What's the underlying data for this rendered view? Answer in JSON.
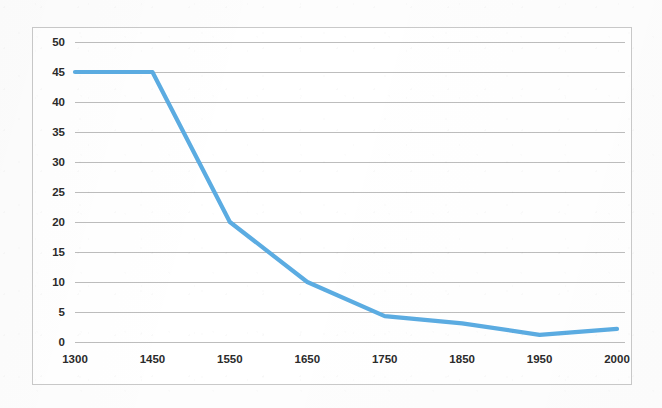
{
  "chart_data": {
    "type": "line",
    "title": "",
    "subtitle": "",
    "xlabel": "",
    "ylabel": "",
    "categories": [
      "1300",
      "1450",
      "1550",
      "1650",
      "1750",
      "1850",
      "1950",
      "2000"
    ],
    "values": [
      45,
      45,
      20,
      10,
      4.3,
      3.1,
      1.2,
      2.2
    ],
    "series": [
      {
        "name": "Series 1",
        "values": [
          45,
          45,
          20,
          10,
          4.3,
          3.1,
          1.2,
          2.2
        ]
      }
    ],
    "ylim": [
      0,
      50
    ],
    "y_ticks": [
      0,
      5,
      10,
      15,
      20,
      25,
      30,
      35,
      40,
      45,
      50
    ],
    "x_ticks": [
      "1300",
      "1450",
      "1550",
      "1650",
      "1750",
      "1850",
      "1950",
      "2000"
    ],
    "grid": "horizontal",
    "legend": "none",
    "annotations": [],
    "colors": {
      "line": "#5BACE2",
      "gridline": "#BDBDBD",
      "frame_border": "#C9C9C9",
      "plot_background": "#FFFFFF",
      "page_background": "#FDFDFD",
      "tick_label": "#2B2B2B"
    }
  }
}
